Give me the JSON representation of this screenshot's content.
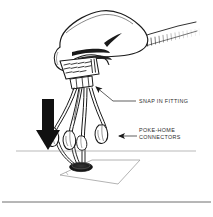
{
  "figure": {
    "background_color": "#ffffff",
    "ink_color": "#1a1a1a",
    "text_color": "#2b2b2b",
    "width": 213,
    "height": 217
  },
  "labels": {
    "snap_in_fitting": "SNAP IN FITTING",
    "poke_home_line1": "POKE-HOME",
    "poke_home_line2": "CONNECTORS"
  },
  "callouts": [
    {
      "name": "snap-in-fitting",
      "text": "SNAP IN FITTING",
      "text_x": 138,
      "text_y": 103,
      "leader": "M136,101 L113,101 L93,85",
      "arrow_at": [
        93,
        85
      ]
    },
    {
      "name": "poke-home-connectors",
      "text_line1": "POKE-HOME",
      "text_line2": "CONNECTORS",
      "text_x": 138,
      "text_y": 132,
      "leader": "M135,137 L116,137",
      "arrow_at": [
        116,
        137
      ]
    }
  ],
  "annotations": {
    "install_arrow": {
      "name": "downward-installation-arrow",
      "direction": "down",
      "color": "#111111",
      "x": 48,
      "y_top": 99,
      "y_bottom": 150
    },
    "reference_line": {
      "name": "panel-reference-line",
      "x_start": 16,
      "x_end": 196,
      "y": 151,
      "style": "thin-gray"
    },
    "bottom_rule": {
      "name": "figure-bottom-rule",
      "x_start": 2,
      "x_end": 211,
      "y": 202
    }
  },
  "components": {
    "hand": {
      "name": "hand-gripping-connector",
      "grip": "fingers-closed"
    },
    "sleeve": {
      "name": "shirt-sleeve-cuff",
      "direction": "upper-right",
      "hatching": true
    },
    "connector_block": {
      "name": "connector-body-block",
      "hatch_marks": true
    },
    "wires": {
      "name": "wire-bundle",
      "count": 5
    },
    "connector_ends": {
      "name": "poke-home-connector-terminal",
      "count": 3
    },
    "panel": {
      "name": "mounting-panel-plate",
      "shape": "parallelogram-perspective"
    },
    "panel_hole": {
      "name": "panel-grommet-hole",
      "shape": "ellipse",
      "fill": "#111111"
    }
  }
}
